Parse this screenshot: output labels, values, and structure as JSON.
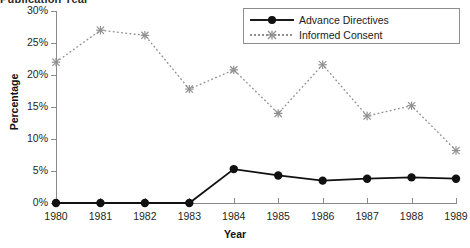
{
  "title_partial": "Publication Year",
  "legend": {
    "position": "top-right",
    "items": [
      {
        "label": "Advance Directives",
        "marker": "filled-circle",
        "line": "solid",
        "color": "#111111"
      },
      {
        "label": "Informed Consent",
        "marker": "star-asterisk",
        "line": "dotted",
        "color": "#8f8f8f"
      }
    ]
  },
  "chart_data": {
    "type": "line",
    "title": "Publication Year",
    "xlabel": "Year",
    "ylabel": "Percentage",
    "categories": [
      "1980",
      "1981",
      "1982",
      "1983",
      "1984",
      "1985",
      "1986",
      "1987",
      "1988",
      "1989"
    ],
    "x": [
      1980,
      1981,
      1982,
      1983,
      1984,
      1985,
      1986,
      1987,
      1988,
      1989
    ],
    "ylim": [
      0,
      30
    ],
    "yticks": [
      0,
      5,
      10,
      15,
      20,
      25,
      30
    ],
    "ytick_labels": [
      "0%",
      "5%",
      "10%",
      "15%",
      "20%",
      "25%",
      "30%"
    ],
    "grid": false,
    "series": [
      {
        "name": "Advance Directives",
        "marker": "filled-circle",
        "line": "solid",
        "color": "#111111",
        "values": [
          0.0,
          0.0,
          0.0,
          0.0,
          5.3,
          4.3,
          3.5,
          3.8,
          4.0,
          3.8
        ]
      },
      {
        "name": "Informed Consent",
        "marker": "star-asterisk",
        "line": "dotted",
        "color": "#8f8f8f",
        "values": [
          22.0,
          27.0,
          26.2,
          17.8,
          20.8,
          14.0,
          21.6,
          13.6,
          15.2,
          8.2
        ]
      }
    ]
  }
}
